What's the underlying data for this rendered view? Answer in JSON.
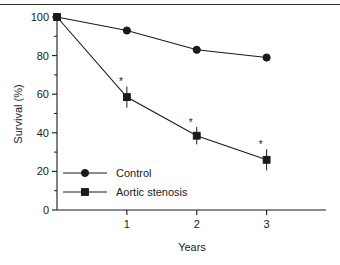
{
  "chart_data": {
    "type": "line",
    "title": "",
    "xlabel": "Years",
    "ylabel": "Survival (%)",
    "x": [
      0,
      1,
      2,
      3
    ],
    "xlim": [
      0,
      3.85
    ],
    "ylim": [
      0,
      100
    ],
    "xticks": [
      1,
      2,
      3
    ],
    "xticklabels": [
      "1",
      "2",
      "3"
    ],
    "yticks": [
      0,
      20,
      40,
      60,
      80,
      100
    ],
    "yticklabels": [
      "0",
      "20",
      "40",
      "60",
      "80",
      "100"
    ],
    "yminorticks": [
      10,
      30,
      50,
      70,
      90
    ],
    "grid": false,
    "legend_position": "inside-lower-left",
    "series": [
      {
        "name": "Control",
        "marker": "circle",
        "values": [
          100,
          93,
          83,
          79
        ],
        "errors": [
          0,
          0,
          0,
          0
        ],
        "significance": [
          "",
          "",
          "",
          ""
        ]
      },
      {
        "name": "Aortic stenosis",
        "marker": "square",
        "values": [
          100,
          58.5,
          38.5,
          26
        ],
        "errors": [
          0,
          5.5,
          4.5,
          5.5
        ],
        "significance": [
          "",
          "*",
          "*",
          "*"
        ]
      }
    ],
    "annotations": [
      "*",
      "*",
      "*"
    ]
  },
  "legend": {
    "items": [
      {
        "label": "Control",
        "marker": "circle"
      },
      {
        "label": "Aortic stenosis",
        "marker": "square"
      }
    ]
  },
  "colors": {
    "ink": "#1a1a1a",
    "background": "#ffffff",
    "rule": "#2b2b2b"
  }
}
